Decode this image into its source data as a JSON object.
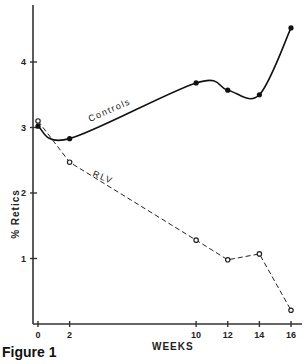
{
  "figure": {
    "caption": "Figure 1"
  },
  "chart_data": {
    "type": "line",
    "title": "",
    "xlabel": "WEEKS",
    "ylabel": "% Retics",
    "x": [
      0,
      2,
      10,
      12,
      14,
      16
    ],
    "x_ticks": [
      "0",
      "2",
      "10",
      "12",
      "14",
      "16"
    ],
    "y_ticks": [
      "1",
      "2",
      "3",
      "4"
    ],
    "xlim": [
      0,
      16
    ],
    "ylim": [
      0,
      4.8
    ],
    "grid": false,
    "legend": "inline labels on curves",
    "series": [
      {
        "name": "Controls",
        "style": "solid line, filled circle markers",
        "values": [
          3.02,
          2.83,
          3.68,
          3.57,
          3.5,
          4.52
        ]
      },
      {
        "name": "RLV",
        "style": "dashed line, open circle markers",
        "values": [
          3.1,
          2.47,
          1.28,
          0.98,
          1.07,
          0.21
        ]
      }
    ]
  }
}
